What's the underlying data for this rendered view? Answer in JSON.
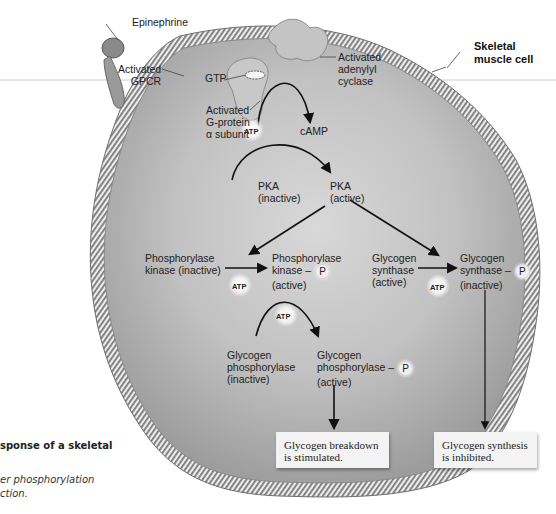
{
  "figure": {
    "cell_label": "Skeletal muscle cell",
    "cell_label_lines": [
      "Skeletal",
      "muscle cell"
    ],
    "membrane_components": {
      "epinephrine": "Epinephrine",
      "gpcr": [
        "Activated",
        "GPCR"
      ],
      "gtp": "GTP",
      "g_protein": [
        "Activated",
        "G-protein",
        "α subunit"
      ],
      "adenylyl_cyclase": [
        "Activated",
        "adenylyl",
        "cyclase"
      ]
    },
    "second_messenger": {
      "substrate": "ATP",
      "product": "cAMP"
    },
    "pka": {
      "inactive": [
        "PKA",
        "(inactive)"
      ],
      "active": [
        "PKA",
        "(active)"
      ]
    },
    "phosphorylase_kinase": {
      "inactive": [
        "Phosphorylase",
        "kinase (inactive)"
      ],
      "active_line1": "Phosphorylase",
      "active_line2": "kinase –",
      "active_line3": "(active)",
      "cofactor": "ATP"
    },
    "glycogen_phosphorylase": {
      "inactive": [
        "Glycogen",
        "phosphorylase",
        "(inactive)"
      ],
      "active_line1": "Glycogen",
      "active_line2": "phosphorylase –",
      "active_line3": "(active)",
      "cofactor": "ATP"
    },
    "glycogen_synthase": {
      "active": [
        "Glycogen",
        "synthase",
        "(active)"
      ],
      "inactive_line1": "Glycogen",
      "inactive_line2": "synthase –",
      "inactive_line3": "(inactive)",
      "cofactor": "ATP"
    },
    "phosphate_symbol": "P",
    "results": {
      "breakdown": [
        "Glycogen breakdown",
        "is stimulated."
      ],
      "synthesis": [
        "Glycogen synthesis",
        "is inhibited."
      ]
    },
    "caption": {
      "title_fragment": "sponse of a skeletal",
      "italic_line1": "er phosphorylation",
      "italic_line2": "ction."
    }
  },
  "colors": {
    "cytoplasm": "#b9b9b9",
    "cytoplasm_light": "#d6d6d6",
    "membrane_dark": "#6b6b6b",
    "membrane_light": "#e8e8e8",
    "arrow": "#111111",
    "result_box": "#f3f3f3"
  }
}
